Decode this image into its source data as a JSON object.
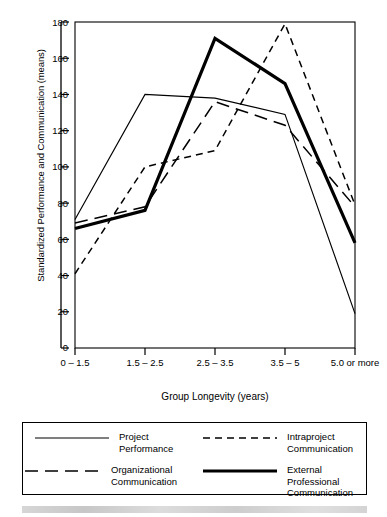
{
  "chart_data": {
    "type": "line",
    "title": "",
    "xlabel": "Group Longevity (years)",
    "ylabel": "Standardized Performance and Communication (means)",
    "categories": [
      "0 – 1.5",
      "1.5 – 2.5",
      "2.5 – 3.5",
      "3.5 – 5",
      "5.0 or\nmore"
    ],
    "ylim": [
      0,
      180
    ],
    "yticks": [
      0,
      20,
      40,
      60,
      80,
      100,
      120,
      140,
      160,
      180
    ],
    "grid": false,
    "legend_position": "bottom",
    "series": [
      {
        "name": "Project\nPerformance",
        "style": "solid-thin",
        "values": [
          71,
          140,
          138,
          129,
          19
        ]
      },
      {
        "name": "Intraproject\nCommunication",
        "style": "dashed-short",
        "values": [
          41,
          100,
          109,
          179,
          79
        ]
      },
      {
        "name": "Organizational\nCommunication",
        "style": "dashed-long",
        "values": [
          69,
          78,
          136,
          123,
          78
        ]
      },
      {
        "name": "External Professional\nCommunication",
        "style": "solid-thick",
        "values": [
          66,
          76,
          171,
          146,
          58
        ]
      }
    ]
  },
  "axis": {
    "y_tick_labels": [
      "0",
      "20",
      "40",
      "60",
      "80",
      "100",
      "120",
      "140",
      "160",
      "180"
    ],
    "x_tick_labels": [
      "0 – 1.5",
      "1.5 – 2.5",
      "2.5 – 3.5",
      "3.5 – 5",
      "5.0 or\nmore"
    ],
    "x_title": "Group Longevity (years)",
    "y_title": "Standardized Performance and Communication (means)"
  },
  "legend": {
    "entries": [
      {
        "label": "Project\nPerformance"
      },
      {
        "label": "Intraproject\nCommunication"
      },
      {
        "label": "Organizational\nCommunication"
      },
      {
        "label": "External Professional\nCommunication"
      }
    ]
  },
  "colors": {
    "ink": "#000000",
    "background": "#ffffff"
  }
}
